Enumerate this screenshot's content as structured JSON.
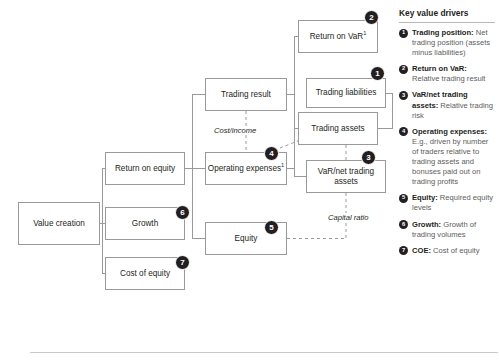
{
  "diagram": {
    "type": "tree",
    "nodes": [
      {
        "id": "value-creation",
        "label": "Value creation",
        "x": 18,
        "y": 202,
        "w": 82,
        "h": 43
      },
      {
        "id": "return-on-equity",
        "label": "Return on equity",
        "x": 105,
        "y": 152,
        "w": 80,
        "h": 33
      },
      {
        "id": "growth",
        "label": "Growth",
        "x": 105,
        "y": 207,
        "w": 80,
        "h": 33
      },
      {
        "id": "cost-of-equity",
        "label": "Cost of equity",
        "x": 105,
        "y": 257,
        "w": 80,
        "h": 33
      },
      {
        "id": "trading-result",
        "label": "Trading result",
        "x": 205,
        "y": 78,
        "w": 82,
        "h": 33
      },
      {
        "id": "operating-expenses",
        "label": "Operating expenses<sup>1</sup>",
        "x": 205,
        "y": 152,
        "w": 82,
        "h": 33
      },
      {
        "id": "equity",
        "label": "Equity",
        "x": 205,
        "y": 222,
        "w": 82,
        "h": 33
      },
      {
        "id": "return-on-var",
        "label": "Return on VaR<sup>1</sup>",
        "x": 298,
        "y": 20,
        "w": 80,
        "h": 33
      },
      {
        "id": "trading-liabilities",
        "label": "Trading liabilities",
        "x": 306,
        "y": 78,
        "w": 80,
        "h": 30
      },
      {
        "id": "trading-assets",
        "label": "Trading assets",
        "x": 298,
        "y": 112,
        "w": 80,
        "h": 33
      },
      {
        "id": "var-net-trading-assets",
        "label": "VaR/net trading assets",
        "x": 306,
        "y": 160,
        "w": 80,
        "h": 33
      }
    ],
    "edge_labels": [
      {
        "id": "cost-income",
        "text": "Cost/income",
        "x": 212,
        "y": 126
      },
      {
        "id": "capital-ratio",
        "text": "Capital ratio",
        "x": 326,
        "y": 213
      }
    ],
    "badges": [
      {
        "id": "badge-1",
        "number": "1",
        "x": 370,
        "y": 66
      },
      {
        "id": "badge-2",
        "number": "2",
        "x": 364,
        "y": 10
      },
      {
        "id": "badge-3",
        "number": "3",
        "x": 361,
        "y": 150
      },
      {
        "id": "badge-4",
        "number": "4",
        "x": 264,
        "y": 146
      },
      {
        "id": "badge-5",
        "number": "5",
        "x": 264,
        "y": 220
      },
      {
        "id": "badge-6",
        "number": "6",
        "x": 175,
        "y": 205
      },
      {
        "id": "badge-7",
        "number": "7",
        "x": 175,
        "y": 255
      }
    ]
  },
  "legend": {
    "title": "Key value drivers",
    "items": [
      {
        "number": "1",
        "term": "Trading position:",
        "description": " Net trading position (assets minus liabilities)"
      },
      {
        "number": "2",
        "term": "Return on VaR:",
        "description": " Relative trading result"
      },
      {
        "number": "3",
        "term": "VaR/net trading assets:",
        "description": " Relative trading risk"
      },
      {
        "number": "4",
        "term": "Operating expenses:",
        "description": " E.g., driven by number of traders relative to trading assets and bonuses paid out on trading profits"
      },
      {
        "number": "5",
        "term": "Equity:",
        "description": " Required equity levels"
      },
      {
        "number": "6",
        "term": "Growth:",
        "description": " Growth of trading volumes"
      },
      {
        "number": "7",
        "term": "COE:",
        "description": " Cost of equity"
      }
    ]
  }
}
